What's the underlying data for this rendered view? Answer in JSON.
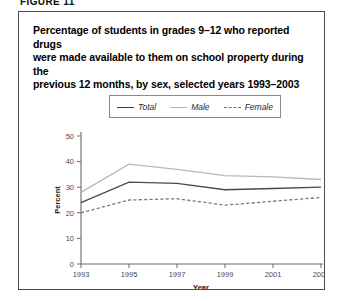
{
  "figure_label": "FIGURE 11",
  "title": "Percentage of students in grades 9–12 who reported drugs were made available to them on school property during the previous 12 months, by sex, selected years 1993–2003",
  "title_lines": [
    "Percentage of students in grades 9–12 who reported drugs",
    "were made available to them on school property during the",
    "previous 12 months, by sex, selected years 1993–2003"
  ],
  "legend": {
    "entries": [
      {
        "label": "Total",
        "style": "solid",
        "color": "#4a4a4a"
      },
      {
        "label": "Male",
        "style": "solid",
        "color": "#b8b8b8"
      },
      {
        "label": "Female",
        "style": "dashed",
        "color": "#7a7a7a"
      }
    ]
  },
  "chart_data": {
    "type": "line",
    "title": "Percentage of students in grades 9–12 who reported drugs were made available to them on school property during the previous 12 months, by sex, selected years 1993–2003",
    "xlabel": "Year",
    "ylabel": "Percent",
    "x": [
      1993,
      1995,
      1997,
      1999,
      2001,
      2003
    ],
    "xtick_labels": [
      "1993",
      "1995",
      "1997",
      "1999",
      "2001",
      "2003"
    ],
    "ytick_labels": [
      "0",
      "10",
      "20",
      "30",
      "40",
      "50"
    ],
    "yticks": [
      0,
      10,
      20,
      30,
      40,
      50
    ],
    "xlim": [
      1993,
      2003
    ],
    "ylim": [
      0,
      50
    ],
    "grid": false,
    "legend_position": "above-plot",
    "series": [
      {
        "name": "Total",
        "values": [
          24.0,
          32.0,
          31.5,
          29.0,
          29.5,
          30.0
        ]
      },
      {
        "name": "Male",
        "values": [
          28.0,
          39.0,
          37.0,
          34.5,
          34.0,
          33.0
        ]
      },
      {
        "name": "Female",
        "values": [
          20.0,
          25.0,
          25.5,
          23.0,
          24.5,
          26.0
        ]
      }
    ]
  }
}
